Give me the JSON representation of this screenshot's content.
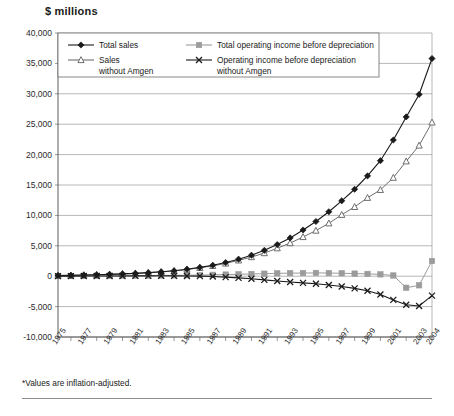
{
  "chart": {
    "title": "$ millions",
    "footnote": "*Values are inflation-adjusted."
  },
  "chart_data": {
    "type": "line",
    "title": "$ millions",
    "xlabel": "",
    "ylabel": "$ millions",
    "ylim": [
      -10000,
      40000
    ],
    "ytick_step": 5000,
    "ytick_labels": [
      "40,000",
      "35,000",
      "30,000",
      "25,000",
      "20,000",
      "15,000",
      "10,000",
      "5,000",
      "0",
      "-5,000",
      "-10,000"
    ],
    "grid": true,
    "legend_position": "top-left-inside",
    "x": [
      1975,
      1976,
      1977,
      1978,
      1979,
      1980,
      1981,
      1982,
      1983,
      1984,
      1985,
      1986,
      1987,
      1988,
      1989,
      1990,
      1991,
      1992,
      1993,
      1994,
      1995,
      1996,
      1997,
      1998,
      1999,
      2000,
      2001,
      2002,
      2003,
      2004
    ],
    "xtick_labels": [
      "1975",
      "1977",
      "1979",
      "1981",
      "1983",
      "1985",
      "1987",
      "1989",
      "1991",
      "1993",
      "1995",
      "1997",
      "1999",
      "2001",
      "2003",
      "2004"
    ],
    "series": [
      {
        "name": "Total sales",
        "marker": "diamond",
        "color": "#1a1a1a",
        "values": [
          120,
          150,
          190,
          240,
          300,
          380,
          470,
          580,
          720,
          900,
          1150,
          1450,
          1800,
          2250,
          2800,
          3450,
          4250,
          5200,
          6300,
          7600,
          9000,
          10600,
          12400,
          14300,
          16500,
          19000,
          22400,
          26200,
          29900,
          35800
        ]
      },
      {
        "name": "Sales without Amgen",
        "marker": "triangle",
        "color": "#6e6e6e",
        "values": [
          120,
          150,
          190,
          240,
          300,
          380,
          465,
          570,
          700,
          870,
          1100,
          1380,
          1700,
          2100,
          2600,
          3150,
          3800,
          4600,
          5450,
          6450,
          7500,
          8700,
          10100,
          11400,
          12900,
          14200,
          16200,
          18900,
          21500,
          25300
        ]
      },
      {
        "name": "Total operating income before depreciation",
        "marker": "square",
        "color": "#9b9b9b",
        "values": [
          20,
          25,
          30,
          40,
          50,
          60,
          75,
          90,
          110,
          130,
          160,
          190,
          230,
          270,
          320,
          370,
          420,
          470,
          500,
          520,
          540,
          520,
          480,
          430,
          380,
          300,
          120,
          -1900,
          -1500,
          2500
        ]
      },
      {
        "name": "Operating income before depreciation without Amgen",
        "marker": "cross",
        "color": "#1a1a1a",
        "values": [
          15,
          18,
          22,
          28,
          35,
          42,
          50,
          58,
          65,
          60,
          40,
          10,
          -60,
          -150,
          -280,
          -430,
          -600,
          -780,
          -950,
          -1100,
          -1250,
          -1450,
          -1700,
          -2000,
          -2400,
          -3000,
          -3900,
          -4700,
          -4900,
          -3200
        ]
      }
    ]
  },
  "legend": {
    "items": [
      {
        "label": "Total sales",
        "marker": "diamond",
        "color": "#1a1a1a"
      },
      {
        "label": "Total operating income before depreciation",
        "marker": "square",
        "color": "#9b9b9b"
      },
      {
        "label": "Sales",
        "label2": "without Amgen",
        "marker": "triangle",
        "color": "#6e6e6e"
      },
      {
        "label": "Operating income before depreciation",
        "label2": "without Amgen",
        "marker": "cross",
        "color": "#1a1a1a"
      }
    ]
  }
}
